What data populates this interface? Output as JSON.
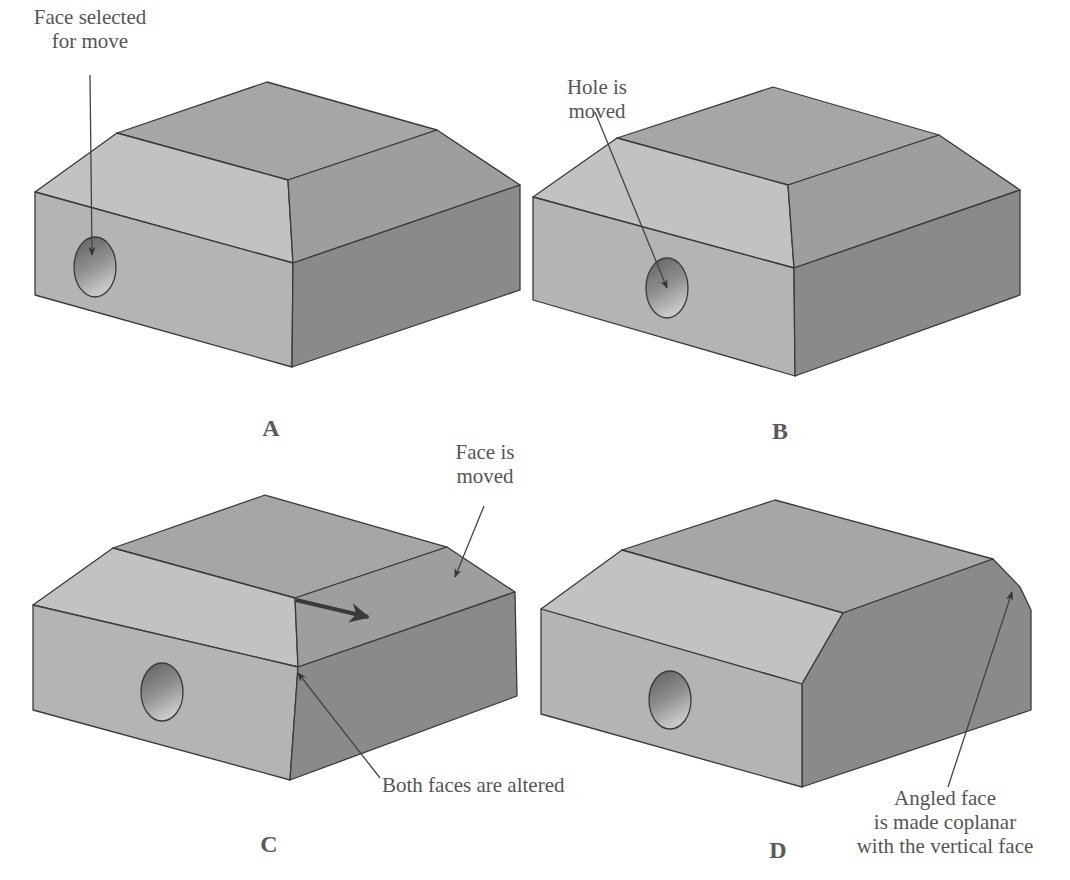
{
  "figure": {
    "colors": {
      "top_face": "#a6a6a6",
      "chamfer_left": "#c2c2c2",
      "chamfer_right": "#9c9c9c",
      "front_face": "#b4b4b4",
      "side_face": "#8a8a8a",
      "edge": "#3a3a3a",
      "label_text": "#555555"
    },
    "panels": [
      {
        "id": "A",
        "letter": "A",
        "callouts": [
          {
            "text_line1": "Face selected",
            "text_line2": "for move"
          }
        ]
      },
      {
        "id": "B",
        "letter": "B",
        "callouts": [
          {
            "text_line1": "Hole is",
            "text_line2": "moved"
          }
        ]
      },
      {
        "id": "C",
        "letter": "C",
        "callouts": [
          {
            "text_line1": "Face is",
            "text_line2": "moved"
          },
          {
            "text_line1": "Both faces are altered"
          }
        ]
      },
      {
        "id": "D",
        "letter": "D",
        "callouts": [
          {
            "text_line1": "Angled face",
            "text_line2": "is made coplanar",
            "text_line3": "with the vertical face"
          }
        ]
      }
    ]
  }
}
